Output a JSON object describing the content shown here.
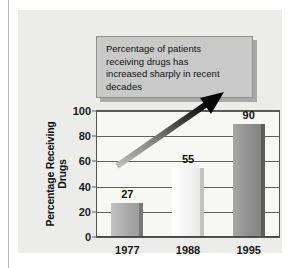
{
  "callout": {
    "text": "Percentage of patients\nreceiving drugs has\nincreased sharply in recent\ndecades"
  },
  "colors": {
    "panel_background": "#ececeb",
    "plot_background": "#f7f7f6",
    "callout_fill": "#c9c9c9",
    "callout_border": "#8f8f8f",
    "callout_shadow": "#a9a9a9",
    "gridline": "#606060",
    "text": "#111111",
    "arrow_start": "#b5b5b5",
    "arrow_end": "#000000",
    "bar_1977": "#a8a8a8",
    "bar_1988": "#f2f2f2",
    "bar_1995": "#8d8d8d"
  },
  "chart_data": {
    "type": "bar",
    "title": "",
    "subtitle": "",
    "categories": [
      "1977",
      "1988",
      "1995"
    ],
    "values": [
      27,
      55,
      90
    ],
    "value_labels": [
      "27",
      "55",
      "90"
    ],
    "xlabel": "",
    "ylabel": "Percentage Receiving Drugs",
    "ylim": [
      0,
      100
    ],
    "yticks": [
      0,
      20,
      40,
      60,
      80,
      100
    ],
    "ytick_labels": [
      "0",
      "20",
      "40",
      "60",
      "80",
      "100"
    ],
    "grid": true,
    "legend": false,
    "legend_position": "none",
    "bar_colors": [
      "#a8a8a8",
      "#f2f2f2",
      "#8d8d8d"
    ],
    "annotations": [
      {
        "name": "trend-arrow",
        "kind": "arrow",
        "note": "Upward diagonal arrow spanning 1977 to 1995 indicating sharp increase",
        "from": {
          "x": "1977",
          "y": 32
        },
        "to": {
          "x": "1995",
          "y": 104
        }
      },
      {
        "name": "callout-box",
        "kind": "textbox",
        "text": "Percentage of patients receiving drugs has increased sharply in recent decades"
      }
    ]
  }
}
